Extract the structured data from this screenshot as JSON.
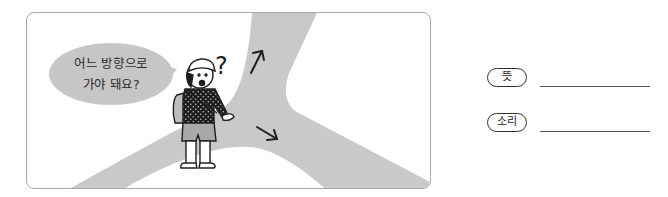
{
  "illustration": {
    "speech_bubble": {
      "line1": "어느 방향으로",
      "line2": "가야 돼요?"
    },
    "question_mark": "?",
    "arrows": [
      "up-right-arrow",
      "down-right-arrow"
    ],
    "colors": {
      "road": "#c9c9c9",
      "bubble": "#c6c6c6",
      "border": "#a9a9a9",
      "ink": "#1e1e1e"
    }
  },
  "answers": [
    {
      "label": "뜻",
      "value": ""
    },
    {
      "label": "소리",
      "value": ""
    }
  ]
}
